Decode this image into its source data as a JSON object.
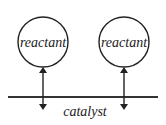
{
  "diagram": {
    "nodes": [
      {
        "id": "reactant-1",
        "label": "reactant",
        "shape": "circle",
        "cx": 43,
        "cy": 42,
        "r": 25
      },
      {
        "id": "reactant-2",
        "label": "reactant",
        "shape": "circle",
        "cx": 124,
        "cy": 42,
        "r": 25
      }
    ],
    "surface": {
      "label": "catalyst",
      "y": 97,
      "x1": 8,
      "x2": 158
    },
    "edges": [
      {
        "from": "reactant-1",
        "to": "catalyst",
        "type": "double-arrow"
      },
      {
        "from": "reactant-2",
        "to": "catalyst",
        "type": "double-arrow"
      }
    ],
    "colors": {
      "stroke": "#222222",
      "background": "#ffffff"
    }
  }
}
